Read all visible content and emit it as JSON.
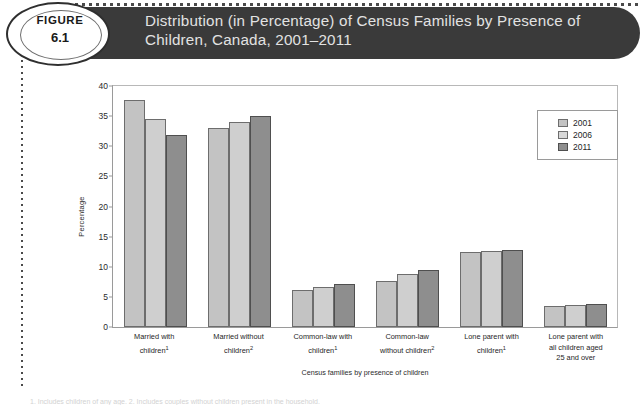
{
  "figure": {
    "badge_label": "FIGURE",
    "badge_number": "6.1",
    "title": "Distribution (in Percentage) of Census Families by Presence of Children, Canada, 2001–2011"
  },
  "footnote": "1. Includes children of any age. 2. Includes couples without children present in the household.",
  "chart_data": {
    "type": "bar",
    "title": "Distribution (in Percentage) of Census Families by Presence of Children, Canada, 2001–2011",
    "xlabel": "Census families by presence of children",
    "ylabel": "Percentage",
    "ylim": [
      0,
      40
    ],
    "yticks": [
      0,
      5,
      10,
      15,
      20,
      25,
      30,
      35,
      40
    ],
    "grid": false,
    "legend_position": "top-right",
    "categories": [
      "Married with children¹",
      "Married without children²",
      "Common-law with children¹",
      "Common-law without children²",
      "Lone parent with children¹",
      "Lone parent with all children aged 25 and over"
    ],
    "category_lines": [
      [
        "Married with",
        "children",
        "1"
      ],
      [
        "Married without",
        "children",
        "2"
      ],
      [
        "Common-law with",
        "children",
        "1"
      ],
      [
        "Common-law",
        "without children",
        "2"
      ],
      [
        "Lone parent with",
        "children",
        "1"
      ],
      [
        "Lone parent with",
        "all children aged",
        "25 and over"
      ]
    ],
    "series": [
      {
        "name": "2001",
        "color": "#c3c3c3",
        "values": [
          37.6,
          33.1,
          6.1,
          7.6,
          12.5,
          3.5
        ]
      },
      {
        "name": "2006",
        "color": "#cfcfcf",
        "values": [
          34.6,
          34.0,
          6.7,
          8.8,
          12.6,
          3.6
        ]
      },
      {
        "name": "2011",
        "color": "#8e8e8e",
        "values": [
          31.9,
          35.1,
          7.2,
          9.5,
          12.8,
          3.8
        ]
      }
    ]
  }
}
